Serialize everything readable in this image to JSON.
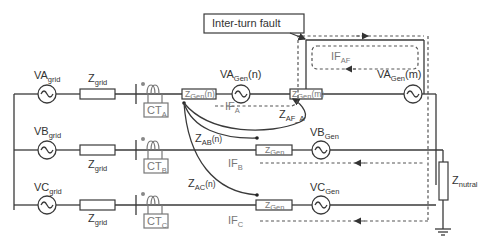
{
  "diagram": {
    "title_box": "Inter-turn fault",
    "grid_sources": {
      "a": {
        "base": "VA",
        "sub": "grid"
      },
      "b": {
        "base": "VB",
        "sub": "grid"
      },
      "c": {
        "base": "VC",
        "sub": "grid"
      }
    },
    "grid_impedance": {
      "base": "Z",
      "sub": "grid"
    },
    "current_transformers": {
      "a": {
        "base": "CT",
        "sub": "A"
      },
      "b": {
        "base": "CT",
        "sub": "B"
      },
      "c": {
        "base": "CT",
        "sub": "C"
      }
    },
    "gen_impedance_n": {
      "base": "Z",
      "sub": "Gen",
      "suffix": "(n)"
    },
    "gen_impedance_m": {
      "base": "Z",
      "sub": "Gen",
      "suffix": "(m)"
    },
    "gen_impedance": {
      "base": "Z",
      "sub": "Gen"
    },
    "gen_sources": {
      "a_n": {
        "base": "VA",
        "sub": "Gen",
        "suffix": "(n)"
      },
      "a_m": {
        "base": "VA",
        "sub": "Gen",
        "suffix": "(m)"
      },
      "b": {
        "base": "VB",
        "sub": "Gen"
      },
      "c": {
        "base": "VC",
        "sub": "Gen"
      }
    },
    "mutual_impedances": {
      "af_a": {
        "base": "Z",
        "sub": "AF_A"
      },
      "ab": {
        "base": "Z",
        "sub": "AB",
        "suffix": "(n)"
      },
      "ac": {
        "base": "Z",
        "sub": "AC",
        "suffix": "(n)"
      }
    },
    "currents": {
      "ia": {
        "base": "IF",
        "sub": "A"
      },
      "iaf": {
        "base": "IF",
        "sub": "AF"
      },
      "ib": {
        "base": "IF",
        "sub": "B"
      },
      "ic": {
        "base": "IF",
        "sub": "C"
      }
    },
    "neutral_impedance": {
      "base": "Z",
      "sub": "nutral"
    }
  }
}
